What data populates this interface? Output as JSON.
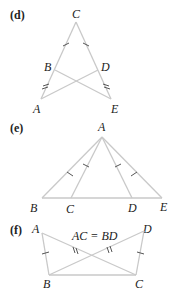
{
  "figure_d": {
    "part_label": "(d)",
    "points": {
      "C": "C",
      "B": "B",
      "D": "D",
      "A": "A",
      "E": "E"
    }
  },
  "figure_e": {
    "part_label": "(e)",
    "points": {
      "A": "A",
      "B": "B",
      "C": "C",
      "D": "D",
      "E": "E"
    }
  },
  "figure_f": {
    "part_label": "(f)",
    "points": {
      "A": "A",
      "B": "B",
      "C": "C",
      "D": "D"
    },
    "equation": "AC = BD"
  },
  "colors": {
    "line": "#c9c9c9",
    "tick": "#555555",
    "text": "#222222"
  }
}
